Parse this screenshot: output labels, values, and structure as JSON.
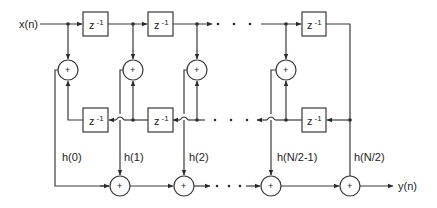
{
  "diagram": {
    "input_label": "x(n)",
    "output_label": "y(n)",
    "delay_label": "z",
    "delay_exponent": "-1",
    "adder_symbol": "+",
    "top_delays": [
      {
        "label": "z -1"
      },
      {
        "label": "z -1"
      },
      {
        "label": "z -1"
      }
    ],
    "bottom_delays": [
      {
        "label": "z -1"
      },
      {
        "label": "z -1"
      },
      {
        "label": "z -1"
      }
    ],
    "coefficients": [
      {
        "label": "h(0)"
      },
      {
        "label": "h(1)"
      },
      {
        "label": "h(2)"
      },
      {
        "label": "h(N/2-1)"
      },
      {
        "label": "h(N/2)"
      }
    ],
    "ellipsis": "• • •",
    "line_color": "#3a3a3a",
    "background": "#ffffff"
  }
}
